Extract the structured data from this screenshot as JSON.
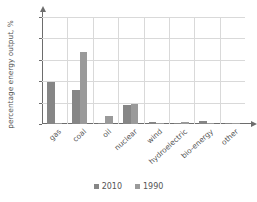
{
  "chart_data": {
    "type": "bar",
    "title": "",
    "xlabel": "",
    "ylabel": "percentage energy output, %",
    "ylim": [
      0,
      100
    ],
    "yticks": [
      0,
      20,
      40,
      60,
      80,
      100
    ],
    "grid": true,
    "legend_position": "bottom",
    "categories": [
      "gas",
      "coal",
      "oil",
      "nuclear",
      "wind",
      "hydroelectric",
      "bio-energy",
      "other"
    ],
    "series": [
      {
        "name": "2010",
        "color": "#868686",
        "values": [
          39.5,
          31.5,
          1.0,
          17.5,
          2.0,
          1.3,
          2.5,
          1.3
        ]
      },
      {
        "name": "1990",
        "color": "#9a9a9a",
        "values": [
          0.5,
          67.0,
          7.5,
          18.8,
          0.3,
          2.0,
          0.4,
          0.4
        ]
      }
    ]
  },
  "axes": {
    "y_tick_labels": [
      "0",
      "20",
      "40",
      "60",
      "80",
      "100"
    ],
    "y_axis_title": "percentage energy output, %"
  },
  "legend": {
    "entries": [
      {
        "label": "2010",
        "color": "#868686"
      },
      {
        "label": "1990",
        "color": "#9a9a9a"
      }
    ]
  },
  "colors": {
    "series_2010": "#868686",
    "series_1990": "#9a9a9a",
    "grid": "#d9d9d9",
    "axis": "#6d6d6d",
    "text": "#555555",
    "background": "#ffffff"
  }
}
